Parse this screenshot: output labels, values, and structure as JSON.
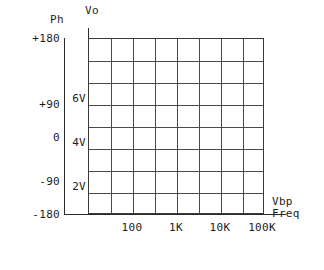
{
  "chart_data": {
    "type": "line",
    "title": "",
    "subtitle": "",
    "series": [],
    "grid": {
      "visible": true,
      "columns": 8,
      "rows": 8
    },
    "legend": {
      "visible": false,
      "position": "none"
    },
    "axes": {
      "phase": {
        "name": "Ph",
        "label": "Ph",
        "unit": "degrees",
        "position": "left-outer",
        "ticks": [
          "+180",
          "+90",
          "0",
          "-90",
          "-180"
        ],
        "tick_values": [
          180,
          90,
          0,
          -90,
          -180
        ],
        "range": [
          -180,
          180
        ]
      },
      "voltage": {
        "name": "Vo",
        "label": "Vo",
        "unit": "V",
        "position": "left-inner",
        "ticks": [
          "6V",
          "4V",
          "2V"
        ],
        "tick_values": [
          6,
          4,
          2
        ],
        "range": [
          0,
          8
        ]
      },
      "frequency": {
        "name": "Freq",
        "label": "Freq",
        "secondary_label": "Vbp",
        "unit": "Hz",
        "position": "bottom",
        "scale": "log",
        "ticks": [
          "100",
          "1K",
          "10K",
          "100K"
        ],
        "tick_values": [
          100,
          1000,
          10000,
          100000
        ],
        "range": [
          10,
          1000000
        ]
      }
    },
    "colors": {
      "background": "#ffffff",
      "grid_line": "#4a4a4a",
      "axis_line": "#2b2b2b",
      "border": "#3a3a3a",
      "text": "#1c1c1c"
    }
  },
  "chart": {
    "phase_axis_caption": "Ph",
    "voltage_axis_caption": "Vo",
    "freq_caption_primary": "Vbp",
    "freq_caption_secondary": "Freq",
    "phase_ticks": [
      {
        "label": "+180",
        "top": 33
      },
      {
        "label": "+90",
        "top": 99
      },
      {
        "label": "0",
        "top": 132
      },
      {
        "label": "-90",
        "top": 176
      },
      {
        "label": "-180",
        "top": 209
      }
    ],
    "voltage_ticks": [
      {
        "label": "6V",
        "top": 93
      },
      {
        "label": "4V",
        "top": 137
      },
      {
        "label": "2V",
        "top": 181
      }
    ],
    "frequency_ticks": [
      {
        "label": "100",
        "left": 132
      },
      {
        "label": "1K",
        "left": 176
      },
      {
        "label": "10K",
        "left": 220
      },
      {
        "label": "100K",
        "left": 262
      }
    ],
    "grid_vertical_offsets": [
      22,
      44,
      66,
      88,
      110,
      132,
      154
    ],
    "grid_horizontal_offsets": [
      22,
      44,
      66,
      88,
      110,
      132,
      154
    ]
  }
}
